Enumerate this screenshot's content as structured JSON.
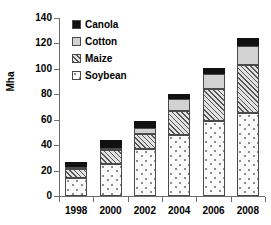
{
  "chart_data": {
    "type": "bar",
    "subtype": "stacked",
    "title": "",
    "xlabel": "",
    "ylabel": "Mha",
    "categories": [
      "1998",
      "2000",
      "2002",
      "2004",
      "2006",
      "2008"
    ],
    "series": [
      {
        "name": "Soybean",
        "values": [
          14,
          25,
          37,
          48,
          59,
          65
        ]
      },
      {
        "name": "Maize",
        "values": [
          7,
          11,
          12,
          19,
          25,
          38
        ]
      },
      {
        "name": "Cotton",
        "values": [
          1.5,
          2,
          4.5,
          9,
          12,
          15
        ]
      },
      {
        "name": "Canola",
        "values": [
          4.5,
          6,
          5.5,
          4,
          5,
          6
        ]
      }
    ],
    "totals": [
      27,
      44,
      59,
      80,
      101,
      124
    ],
    "ylim": [
      0,
      140
    ],
    "yticks": [
      0,
      20,
      40,
      60,
      80,
      100,
      120,
      140
    ],
    "grid": false,
    "legend_position": "top-left",
    "legend_order": [
      "Canola",
      "Cotton",
      "Maize",
      "Soybean"
    ],
    "series_styles": {
      "Canola": {
        "fill": "#111111",
        "pattern": "solid"
      },
      "Cotton": {
        "fill": "#d2d2d2",
        "pattern": "solid"
      },
      "Maize": {
        "fill": "#e2e2e2",
        "pattern": "diagonal-hatch"
      },
      "Soybean": {
        "fill": "#fbfbfb",
        "pattern": "dotted"
      }
    },
    "axis_color": "#6d6d6d",
    "outline_color": "#4a4a4a"
  }
}
